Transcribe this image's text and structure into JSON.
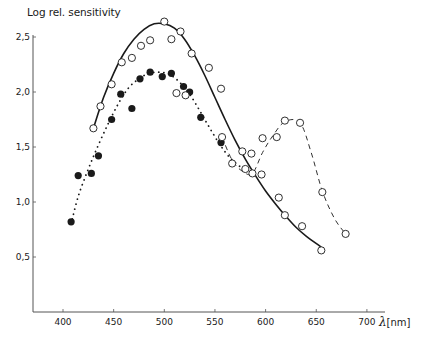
{
  "chart_data": {
    "type": "scatter",
    "title": "",
    "ylabel": "Log rel. sensitivity",
    "xlabel_symbol": "λ",
    "xlabel_unit": "[nm]",
    "xlim": [
      370,
      720
    ],
    "ylim": [
      0,
      2.6
    ],
    "x_ticks": [
      400,
      450,
      500,
      550,
      600,
      650,
      700
    ],
    "x_tick_labels": [
      "400",
      "450",
      "500",
      "550",
      "600",
      "650",
      "700"
    ],
    "y_ticks": [
      0.5,
      1.0,
      1.5,
      2.0,
      2.5
    ],
    "y_tick_labels": [
      "0,5",
      "1,0",
      "1,5",
      "2,0",
      "2,5"
    ],
    "grid": false,
    "legend": null,
    "series": [
      {
        "name": "open circles (solid fitted curve)",
        "marker": "open-circle",
        "line": "solid",
        "points": [
          [
            430,
            1.67
          ],
          [
            437,
            1.87
          ],
          [
            448,
            2.07
          ],
          [
            458,
            2.27
          ],
          [
            468,
            2.31
          ],
          [
            477,
            2.42
          ],
          [
            486,
            2.47
          ],
          [
            500,
            2.64
          ],
          [
            507,
            2.48
          ],
          [
            516,
            2.55
          ],
          [
            527,
            2.35
          ],
          [
            544,
            2.22
          ],
          [
            556,
            2.03
          ],
          [
            577,
            1.46
          ],
          [
            586,
            1.44
          ],
          [
            596,
            1.25
          ],
          [
            613,
            1.04
          ],
          [
            619,
            0.88
          ],
          [
            636,
            0.78
          ],
          [
            655,
            0.56
          ]
        ],
        "curve": [
          [
            430,
            1.67
          ],
          [
            440,
            1.95
          ],
          [
            450,
            2.17
          ],
          [
            460,
            2.35
          ],
          [
            470,
            2.48
          ],
          [
            480,
            2.57
          ],
          [
            490,
            2.62
          ],
          [
            500,
            2.62
          ],
          [
            510,
            2.58
          ],
          [
            520,
            2.48
          ],
          [
            530,
            2.33
          ],
          [
            540,
            2.15
          ],
          [
            550,
            1.95
          ],
          [
            560,
            1.75
          ],
          [
            570,
            1.56
          ],
          [
            580,
            1.39
          ],
          [
            590,
            1.24
          ],
          [
            600,
            1.1
          ],
          [
            610,
            0.98
          ],
          [
            620,
            0.87
          ],
          [
            630,
            0.77
          ],
          [
            640,
            0.69
          ],
          [
            655,
            0.59
          ]
        ]
      },
      {
        "name": "filled circles (dotted curve)",
        "marker": "filled-circle",
        "line": "dotted",
        "points": [
          [
            408,
            0.82
          ],
          [
            415,
            1.24
          ],
          [
            428,
            1.26
          ],
          [
            435,
            1.42
          ],
          [
            448,
            1.75
          ],
          [
            457,
            1.98
          ],
          [
            468,
            1.85
          ],
          [
            476,
            2.12
          ],
          [
            486,
            2.18
          ],
          [
            498,
            2.14
          ],
          [
            507,
            2.17
          ],
          [
            519,
            2.05
          ],
          [
            525,
            2.0
          ],
          [
            536,
            1.77
          ],
          [
            556,
            1.54
          ]
        ],
        "curve": [
          [
            408,
            0.8
          ],
          [
            415,
            1.05
          ],
          [
            425,
            1.3
          ],
          [
            435,
            1.52
          ],
          [
            445,
            1.72
          ],
          [
            455,
            1.9
          ],
          [
            465,
            2.04
          ],
          [
            475,
            2.12
          ],
          [
            485,
            2.17
          ],
          [
            495,
            2.18
          ],
          [
            505,
            2.16
          ],
          [
            515,
            2.09
          ],
          [
            525,
            1.98
          ],
          [
            535,
            1.83
          ],
          [
            545,
            1.67
          ],
          [
            555,
            1.52
          ],
          [
            565,
            1.4
          ],
          [
            575,
            1.32
          ]
        ]
      },
      {
        "name": "open circles (dashed curve)",
        "marker": "open-circle",
        "line": "dashed",
        "points": [
          [
            512,
            1.99
          ],
          [
            521,
            1.97
          ],
          [
            557,
            1.59
          ],
          [
            567,
            1.35
          ],
          [
            580,
            1.3
          ],
          [
            587,
            1.26
          ],
          [
            597,
            1.58
          ],
          [
            611,
            1.59
          ],
          [
            619,
            1.74
          ],
          [
            634,
            1.72
          ],
          [
            656,
            1.09
          ],
          [
            679,
            0.71
          ]
        ],
        "curve": [
          [
            557,
            1.59
          ],
          [
            567,
            1.38
          ],
          [
            577,
            1.28
          ],
          [
            587,
            1.26
          ],
          [
            597,
            1.45
          ],
          [
            607,
            1.6
          ],
          [
            619,
            1.73
          ],
          [
            634,
            1.72
          ],
          [
            645,
            1.45
          ],
          [
            656,
            1.1
          ],
          [
            668,
            0.85
          ],
          [
            679,
            0.71
          ]
        ]
      }
    ]
  },
  "colors": {
    "ink": "#1a1a1a",
    "background": "#ffffff",
    "axis": "#555555"
  }
}
